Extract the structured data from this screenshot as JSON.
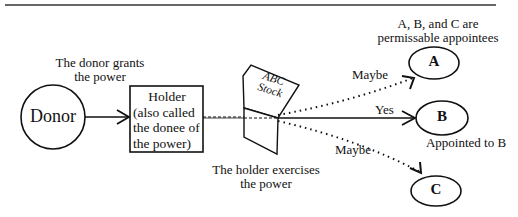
{
  "diagram": {
    "title_rule": true,
    "nodes": {
      "donor": {
        "label": "Donor"
      },
      "holder": {
        "label_lines": [
          "Holder",
          "(also called",
          "the donee of",
          "the power)"
        ]
      },
      "stock": {
        "label_lines": [
          "ABC",
          "Stock"
        ]
      },
      "a": {
        "label": "A"
      },
      "b": {
        "label": "B"
      },
      "c": {
        "label": "C"
      }
    },
    "annotations": {
      "donor_grants": [
        "The donor grants",
        "the power"
      ],
      "holder_exercises": [
        "The holder exercises",
        "the power"
      ],
      "permissible": [
        "A, B, and C are",
        "permissable appointees"
      ],
      "appointed": "Appointed to B"
    },
    "edges": {
      "to_a": {
        "label": "Maybe",
        "style": "dotted"
      },
      "to_b": {
        "label": "Yes",
        "style": "solid"
      },
      "to_c": {
        "label": "Maybe",
        "style": "dotted"
      }
    }
  }
}
